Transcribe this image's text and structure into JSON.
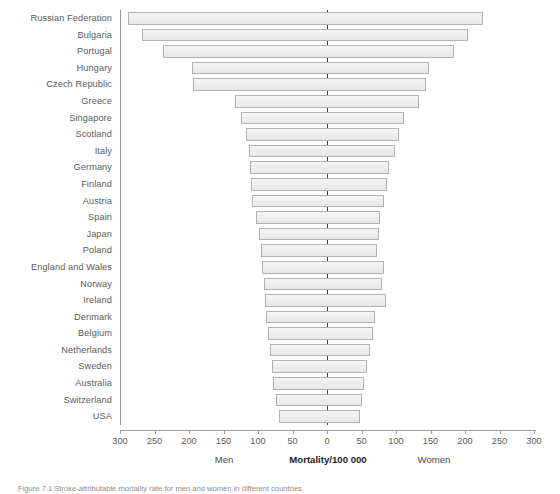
{
  "chart_data": {
    "type": "bar",
    "orientation": "horizontal-pyramid",
    "title": "",
    "subtitle": "",
    "xlabel": "Mortality/100 000",
    "ylabel": "",
    "xlim": [
      -300,
      300
    ],
    "grid": false,
    "legend_position": "below-axis",
    "left_series_label": "Men",
    "right_series_label": "Women",
    "axis_center_value": 0,
    "tick_labels_left": [
      "300",
      "250",
      "200",
      "150",
      "100",
      "50",
      "0"
    ],
    "tick_labels_right": [
      "50",
      "100",
      "150",
      "200",
      "250",
      "300"
    ],
    "tick_values": [
      300,
      250,
      200,
      150,
      100,
      50,
      0,
      50,
      100,
      150,
      200,
      250,
      300
    ],
    "categories": [
      "Russian Federation",
      "Bulgaria",
      "Portugal",
      "Hungary",
      "Czech Republic",
      "Greece",
      "Singapore",
      "Scotland",
      "Italy",
      "Germany",
      "Finland",
      "Austria",
      "Spain",
      "Japan",
      "Poland",
      "England and Wales",
      "Norway",
      "Ireland",
      "Denmark",
      "Belgium",
      "Netherlands",
      "Sweden",
      "Australia",
      "Switzerland",
      "USA"
    ],
    "series": [
      {
        "name": "Men",
        "values": [
          289,
          268,
          237,
          196,
          194,
          133,
          124,
          118,
          113,
          111,
          110,
          109,
          103,
          99,
          96,
          94,
          92,
          90,
          88,
          86,
          83,
          80,
          78,
          74,
          70
        ]
      },
      {
        "name": "Women",
        "values": [
          226,
          205,
          184,
          148,
          143,
          134,
          111,
          104,
          98,
          90,
          87,
          83,
          77,
          75,
          73,
          82,
          79,
          85,
          69,
          67,
          62,
          58,
          53,
          50,
          48
        ]
      }
    ]
  },
  "axis": {
    "xlabel_bold": "Mortality/100 000",
    "men_label": "Men",
    "women_label": "Women"
  },
  "caption": {
    "text": "Figure 7.1   Stroke-attributable mortality rate for men and women in different countries."
  }
}
